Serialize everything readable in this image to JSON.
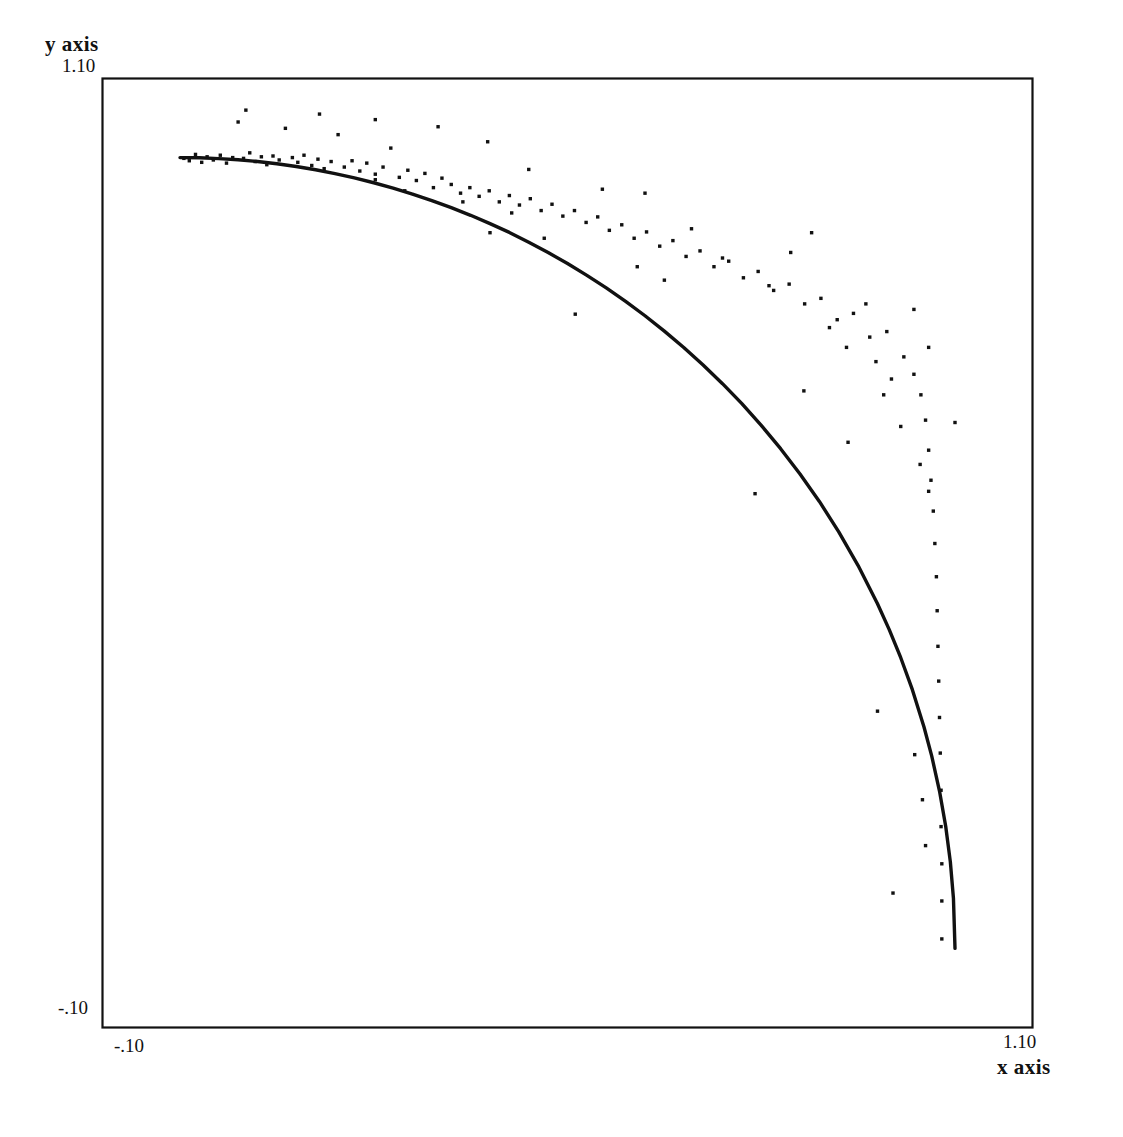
{
  "figure": {
    "background": "#ffffff",
    "ink_color": "#111111"
  },
  "axes": {
    "y_axis_title": "y axis",
    "x_axis_title": "x axis",
    "y_tick_max": "1.10",
    "y_tick_min": "-.10",
    "x_tick_min": "-.10",
    "x_tick_max": "1.10"
  },
  "chart_data": {
    "type": "scatter",
    "title": "",
    "xlabel": "x axis",
    "ylabel": "y axis",
    "xlim": [
      -0.1,
      1.1
    ],
    "ylim": [
      -0.1,
      1.1
    ],
    "xticks": [
      -0.1,
      1.1
    ],
    "yticks": [
      -0.1,
      1.1
    ],
    "xticklabels": [
      "-.10",
      "1.10"
    ],
    "yticklabels": [
      "-.10",
      "1.10"
    ],
    "grid": false,
    "legend": null,
    "frame": "full-box",
    "series": [
      {
        "name": "fitted curve",
        "type": "line",
        "description": "quarter unit circle, x^2 + y^2 = 1, first quadrant",
        "equation": "y = sqrt(1 - x^2)",
        "x": [
          0.0,
          0.025,
          0.05,
          0.075,
          0.1,
          0.125,
          0.15,
          0.175,
          0.2,
          0.225,
          0.25,
          0.275,
          0.3,
          0.325,
          0.35,
          0.375,
          0.4,
          0.425,
          0.45,
          0.475,
          0.5,
          0.525,
          0.55,
          0.575,
          0.6,
          0.625,
          0.65,
          0.675,
          0.7,
          0.725,
          0.75,
          0.775,
          0.8,
          0.825,
          0.85,
          0.875,
          0.9,
          0.915,
          0.93,
          0.945,
          0.96,
          0.97,
          0.98,
          0.988,
          0.994,
          0.998,
          1.0
        ],
        "y": [
          1.0,
          0.9997,
          0.9987,
          0.9972,
          0.995,
          0.9922,
          0.9887,
          0.9846,
          0.9798,
          0.9744,
          0.9682,
          0.9615,
          0.9539,
          0.9457,
          0.9367,
          0.927,
          0.9165,
          0.9054,
          0.893,
          0.8799,
          0.866,
          0.8511,
          0.8352,
          0.8182,
          0.8,
          0.7806,
          0.7599,
          0.7378,
          0.7141,
          0.6888,
          0.6614,
          0.6319,
          0.6,
          0.5652,
          0.5268,
          0.4841,
          0.4359,
          0.4034,
          0.3676,
          0.3272,
          0.28,
          0.2431,
          0.199,
          0.1544,
          0.1094,
          0.0632,
          0.0
        ]
      },
      {
        "name": "observations",
        "type": "scatter",
        "marker": "pixel-dot",
        "points": [
          [
            0.005,
            0.999
          ],
          [
            0.012,
            0.996
          ],
          [
            0.02,
            1.004
          ],
          [
            0.028,
            0.994
          ],
          [
            0.035,
            1.001
          ],
          [
            0.043,
            0.997
          ],
          [
            0.052,
            1.003
          ],
          [
            0.06,
            0.993
          ],
          [
            0.068,
            1.0
          ],
          [
            0.075,
            1.045
          ],
          [
            0.082,
            0.999
          ],
          [
            0.09,
            1.006
          ],
          [
            0.097,
            0.995
          ],
          [
            0.105,
            1.001
          ],
          [
            0.112,
            0.991
          ],
          [
            0.12,
            1.002
          ],
          [
            0.128,
            0.997
          ],
          [
            0.136,
            1.037
          ],
          [
            0.145,
            1.0
          ],
          [
            0.152,
            0.994
          ],
          [
            0.16,
            1.003
          ],
          [
            0.17,
            0.99
          ],
          [
            0.178,
            0.998
          ],
          [
            0.186,
            0.986
          ],
          [
            0.195,
            0.995
          ],
          [
            0.204,
            1.029
          ],
          [
            0.212,
            0.988
          ],
          [
            0.222,
            0.996
          ],
          [
            0.232,
            0.983
          ],
          [
            0.241,
            0.993
          ],
          [
            0.252,
            0.979
          ],
          [
            0.262,
            0.988
          ],
          [
            0.272,
            1.012
          ],
          [
            0.283,
            0.975
          ],
          [
            0.294,
            0.984
          ],
          [
            0.305,
            0.971
          ],
          [
            0.316,
            0.98
          ],
          [
            0.327,
            0.962
          ],
          [
            0.338,
            0.974
          ],
          [
            0.35,
            0.966
          ],
          [
            0.362,
            0.955
          ],
          [
            0.374,
            0.962
          ],
          [
            0.386,
            0.951
          ],
          [
            0.399,
            0.958
          ],
          [
            0.412,
            0.944
          ],
          [
            0.425,
            0.952
          ],
          [
            0.438,
            0.94
          ],
          [
            0.452,
            0.948
          ],
          [
            0.466,
            0.933
          ],
          [
            0.48,
            0.941
          ],
          [
            0.494,
            0.926
          ],
          [
            0.509,
            0.933
          ],
          [
            0.524,
            0.918
          ],
          [
            0.539,
            0.925
          ],
          [
            0.554,
            0.908
          ],
          [
            0.57,
            0.915
          ],
          [
            0.586,
            0.898
          ],
          [
            0.602,
            0.906
          ],
          [
            0.619,
            0.888
          ],
          [
            0.636,
            0.895
          ],
          [
            0.653,
            0.875
          ],
          [
            0.671,
            0.882
          ],
          [
            0.689,
            0.862
          ],
          [
            0.708,
            0.869
          ],
          [
            0.727,
            0.848
          ],
          [
            0.746,
            0.856
          ],
          [
            0.766,
            0.832
          ],
          [
            0.786,
            0.84
          ],
          [
            0.806,
            0.815
          ],
          [
            0.827,
            0.822
          ],
          [
            0.848,
            0.795
          ],
          [
            0.869,
            0.803
          ],
          [
            0.89,
            0.773
          ],
          [
            0.912,
            0.78
          ],
          [
            0.934,
            0.748
          ],
          [
            0.947,
            0.726
          ],
          [
            0.956,
            0.7
          ],
          [
            0.962,
            0.668
          ],
          [
            0.966,
            0.63
          ],
          [
            0.969,
            0.592
          ],
          [
            0.972,
            0.553
          ],
          [
            0.974,
            0.512
          ],
          [
            0.976,
            0.47
          ],
          [
            0.977,
            0.427
          ],
          [
            0.978,
            0.382
          ],
          [
            0.979,
            0.338
          ],
          [
            0.98,
            0.292
          ],
          [
            0.981,
            0.247
          ],
          [
            0.982,
            0.2
          ],
          [
            0.982,
            0.154
          ],
          [
            0.983,
            0.107
          ],
          [
            0.983,
            0.06
          ],
          [
            0.983,
            0.012
          ],
          [
            0.085,
            1.06
          ],
          [
            0.18,
            1.055
          ],
          [
            0.252,
            1.048
          ],
          [
            0.333,
            1.039
          ],
          [
            0.397,
            1.02
          ],
          [
            0.45,
            0.985
          ],
          [
            0.47,
            0.898
          ],
          [
            0.545,
            0.96
          ],
          [
            0.6,
            0.955
          ],
          [
            0.66,
            0.91
          ],
          [
            0.7,
            0.873
          ],
          [
            0.76,
            0.838
          ],
          [
            0.815,
            0.905
          ],
          [
            0.838,
            0.785
          ],
          [
            0.86,
            0.76
          ],
          [
            0.885,
            0.815
          ],
          [
            0.898,
            0.742
          ],
          [
            0.908,
            0.7
          ],
          [
            0.918,
            0.72
          ],
          [
            0.93,
            0.66
          ],
          [
            0.947,
            0.808
          ],
          [
            0.955,
            0.612
          ],
          [
            0.966,
            0.578
          ],
          [
            0.788,
            0.88
          ],
          [
            0.805,
            0.705
          ],
          [
            0.742,
            0.575
          ],
          [
            0.966,
            0.76
          ],
          [
            0.862,
            0.64
          ],
          [
            0.9,
            0.3
          ],
          [
            1.0,
            0.665
          ],
          [
            0.948,
            0.245
          ],
          [
            0.958,
            0.188
          ],
          [
            0.962,
            0.13
          ],
          [
            0.92,
            0.07
          ],
          [
            0.51,
            0.802
          ],
          [
            0.252,
            0.972
          ],
          [
            0.29,
            0.958
          ],
          [
            0.365,
            0.944
          ],
          [
            0.4,
            0.905
          ],
          [
            0.428,
            0.93
          ],
          [
            0.59,
            0.862
          ],
          [
            0.625,
            0.845
          ]
        ]
      }
    ]
  }
}
